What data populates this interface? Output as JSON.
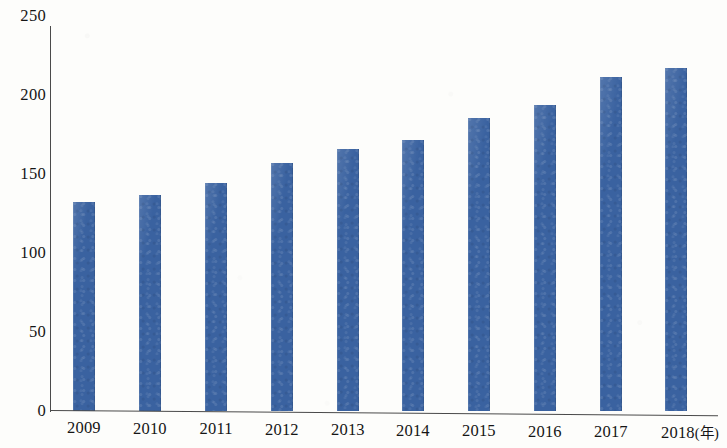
{
  "chart_data": {
    "type": "bar",
    "title": "",
    "subtitle": "",
    "xlabel": "年",
    "ylabel": "",
    "categories": [
      "2009",
      "2010",
      "2011",
      "2012",
      "2013",
      "2014",
      "2015",
      "2016",
      "2017",
      "2018"
    ],
    "x_tick_labels": [
      "2009",
      "2010",
      "2011",
      "2012",
      "2013",
      "2014",
      "2015",
      "2016",
      "2017",
      "2018(年)"
    ],
    "values": [
      136,
      140,
      148,
      161,
      170,
      176,
      190,
      199,
      217,
      223
    ],
    "series": [
      {
        "name": "",
        "values": [
          136,
          140,
          148,
          161,
          170,
          176,
          190,
          199,
          217,
          223
        ]
      }
    ],
    "ylim": [
      0,
      250
    ],
    "y_ticks": [
      0,
      50,
      100,
      150,
      200,
      250
    ],
    "y_tick_labels": [
      "0",
      "50",
      "100",
      "150",
      "200",
      "250"
    ],
    "grid": false,
    "legend": null,
    "legend_position": "none",
    "annotations": [],
    "bar_color": "#3a62a0",
    "axis_color": "#4a4a4a",
    "background_color": "#fdfdfb",
    "x_axis_unit_note": "2018(年)"
  }
}
